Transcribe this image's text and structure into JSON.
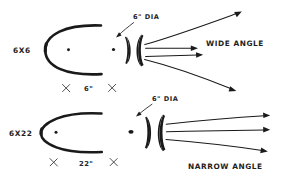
{
  "diagram": {
    "medium": "hand-drawn pen sketch",
    "background_color": "#ffffff",
    "ink_color": "#1a1a1a",
    "width": 282,
    "height": 191
  },
  "rows": [
    {
      "id": "wide",
      "reflector_label": "6X6",
      "dimension_label": "6\"",
      "lens_callout": "6\" DIA",
      "beam_label": "WIDE ANGLE",
      "ray_count": 4,
      "beam_character": "strongly diverging"
    },
    {
      "id": "narrow",
      "reflector_label": "6X22",
      "dimension_label": "22\"",
      "lens_callout": "6\" DIA",
      "beam_label": "NARROW ANGLE",
      "ray_count": 3,
      "beam_character": "nearly collimated"
    }
  ],
  "labels": {
    "reflector_wide": "6X6",
    "reflector_narrow": "6X22",
    "dim_wide": "6\"",
    "dim_narrow": "22\"",
    "callout_wide": "6\" DIA",
    "callout_narrow": "6\" DIA",
    "beam_wide": "WIDE ANGLE",
    "beam_narrow": "NARROW ANGLE"
  },
  "icons": {
    "reflector": "parabolic-reflector-icon",
    "source": "light-source-dot-icon",
    "lens": "lens-crescent-icon",
    "ray": "light-ray-arrow-icon",
    "tick": "dimension-tick-icon",
    "leader": "leader-arrow-icon"
  }
}
